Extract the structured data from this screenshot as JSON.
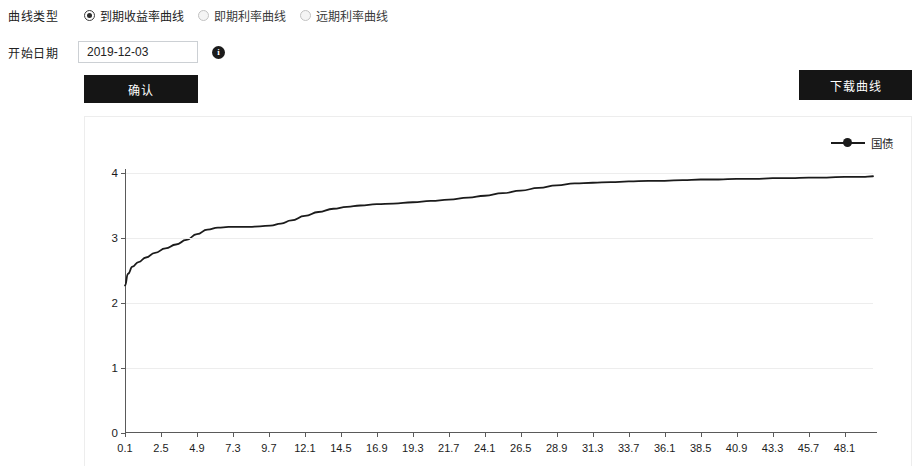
{
  "form": {
    "curve_type_label": "曲线类型",
    "options": [
      {
        "label": "到期收益率曲线",
        "selected": true
      },
      {
        "label": "即期利率曲线",
        "selected": false
      },
      {
        "label": "远期利率曲线",
        "selected": false
      }
    ],
    "start_date_label": "开始日期",
    "start_date_value": "2019-12-03",
    "start_date_placeholder": "2019-12-03",
    "info_icon": "info-icon",
    "confirm_label": "确认",
    "download_label": "下载曲线"
  },
  "chart_data": {
    "type": "line",
    "title": "",
    "xlabel": "",
    "ylabel": "",
    "legend": [
      {
        "name": "国债",
        "color": "#1b1b1b",
        "marker": "circle"
      }
    ],
    "legend_position": "top-right",
    "grid": true,
    "xlim": [
      0.1,
      50.0
    ],
    "ylim": [
      0,
      4
    ],
    "yticks": [
      "0",
      "1",
      "2",
      "3",
      "4"
    ],
    "ytick_values": [
      0,
      1,
      2,
      3,
      4
    ],
    "xticks": [
      "0.1",
      "2.5",
      "4.9",
      "7.3",
      "9.7",
      "12.1",
      "14.5",
      "16.9",
      "19.3",
      "21.7",
      "24.1",
      "26.5",
      "28.9",
      "31.3",
      "33.7",
      "36.1",
      "38.5",
      "40.9",
      "43.3",
      "45.7",
      "48.1"
    ],
    "xtick_values": [
      0.1,
      2.5,
      4.9,
      7.3,
      9.7,
      12.1,
      14.5,
      16.9,
      19.3,
      21.7,
      24.1,
      26.5,
      28.9,
      31.3,
      33.7,
      36.1,
      38.5,
      40.9,
      43.3,
      45.7,
      48.1
    ],
    "series": [
      {
        "name": "国债",
        "x": [
          0.1,
          0.3,
          0.6,
          1.0,
          1.5,
          2.1,
          2.8,
          3.5,
          4.2,
          4.9,
          5.6,
          6.3,
          7.0,
          7.7,
          8.4,
          9.1,
          9.8,
          10.5,
          11.2,
          12.1,
          13.0,
          14.0,
          14.9,
          15.8,
          16.9,
          18.0,
          19.3,
          20.5,
          21.7,
          23.0,
          24.1,
          25.3,
          26.5,
          27.7,
          28.9,
          30.1,
          31.3,
          32.5,
          33.7,
          35.0,
          36.1,
          37.3,
          38.5,
          39.7,
          40.9,
          42.1,
          43.3,
          44.5,
          45.7,
          46.9,
          48.1,
          49.3,
          50.0
        ],
        "y": [
          2.27,
          2.45,
          2.56,
          2.63,
          2.7,
          2.77,
          2.84,
          2.9,
          2.97,
          3.06,
          3.13,
          3.16,
          3.17,
          3.17,
          3.17,
          3.18,
          3.19,
          3.22,
          3.27,
          3.34,
          3.4,
          3.45,
          3.48,
          3.5,
          3.52,
          3.53,
          3.55,
          3.57,
          3.59,
          3.62,
          3.65,
          3.69,
          3.73,
          3.77,
          3.81,
          3.84,
          3.85,
          3.86,
          3.87,
          3.88,
          3.88,
          3.89,
          3.9,
          3.9,
          3.91,
          3.91,
          3.92,
          3.92,
          3.93,
          3.93,
          3.94,
          3.94,
          3.95
        ]
      }
    ]
  }
}
